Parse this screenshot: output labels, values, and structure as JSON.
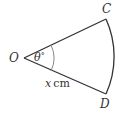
{
  "diagram": {
    "type": "sector",
    "points": {
      "center": "O",
      "arc_start": "C",
      "arc_end": "D"
    },
    "angle_label": {
      "symbol": "θ",
      "unit": "°"
    },
    "radius_label": {
      "variable": "x",
      "unit": "cm"
    },
    "colors": {
      "stroke": "#333333",
      "angle_arc": "#888888",
      "background": "#ffffff"
    }
  }
}
